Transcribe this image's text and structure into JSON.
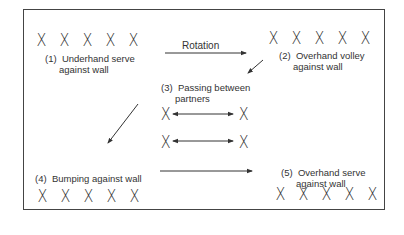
{
  "diagram": {
    "rotation_label": "Rotation",
    "stations": [
      {
        "number": "(1)",
        "line1": "Underhand serve",
        "line2": "against wall",
        "players": [
          "X",
          "X",
          "X",
          "X",
          "X"
        ]
      },
      {
        "number": "(2)",
        "line1": "Overhand volley",
        "line2": "against wall",
        "players": [
          "X",
          "X",
          "X",
          "X",
          "X"
        ]
      },
      {
        "number": "(3)",
        "line1": "Passing between",
        "line2": "partners",
        "players": [
          "X",
          "X",
          "X",
          "X"
        ]
      },
      {
        "number": "(4)",
        "line1": "Bumping against wall",
        "line2": "",
        "players": [
          "X",
          "X",
          "X",
          "X",
          "X"
        ]
      },
      {
        "number": "(5)",
        "line1": "Overhand serve",
        "line2": "against wall",
        "players": [
          "X",
          "X",
          "X",
          "X",
          "X"
        ]
      }
    ],
    "colors": {
      "line": "#333333",
      "text": "#333333",
      "background": "#ffffff"
    }
  }
}
